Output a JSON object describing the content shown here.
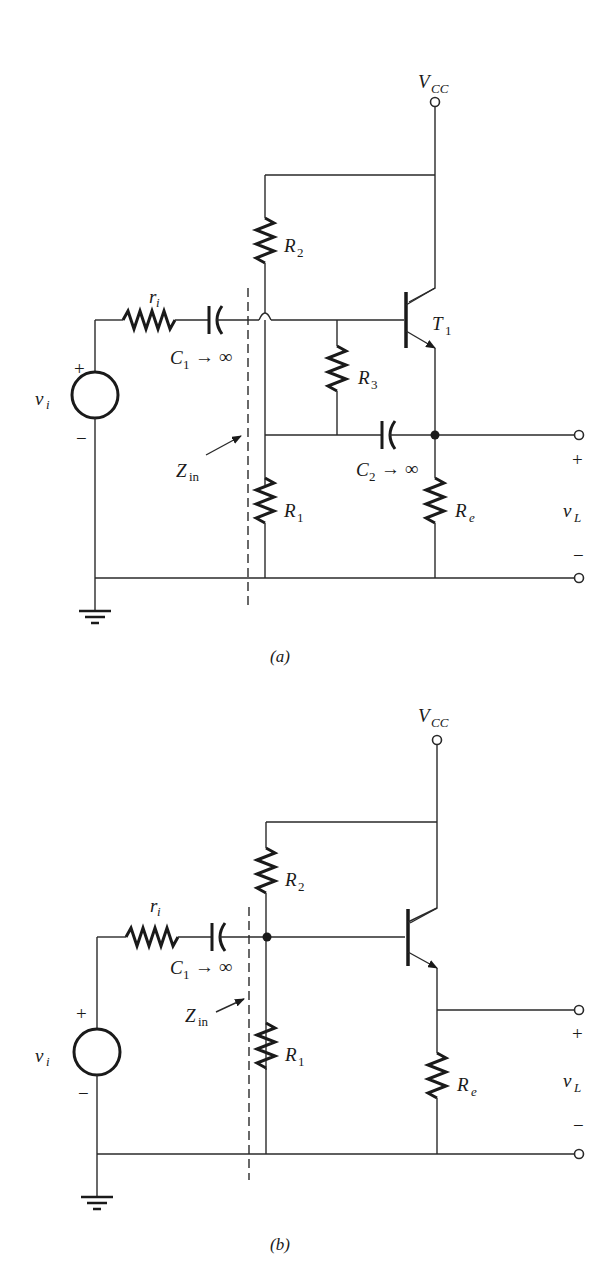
{
  "figure": {
    "colors": {
      "ink": "#1a1a1a",
      "background": "#ffffff"
    }
  },
  "circuit_a": {
    "caption": "(a)",
    "supply": {
      "label": "V",
      "sub": "CC"
    },
    "source": {
      "label": "v",
      "sub": "i",
      "plus": "+",
      "minus": "−"
    },
    "source_resistor": {
      "label": "r",
      "sub": "i"
    },
    "c1": {
      "label": "C",
      "sub": "1",
      "note": "→ ∞"
    },
    "c2": {
      "label": "C",
      "sub": "2",
      "note": "→ ∞"
    },
    "r1": {
      "label": "R",
      "sub": "1"
    },
    "r2": {
      "label": "R",
      "sub": "2"
    },
    "r3": {
      "label": "R",
      "sub": "3"
    },
    "re": {
      "label": "R",
      "sub": "e"
    },
    "transistor": {
      "label": "T",
      "sub": "1"
    },
    "zin": {
      "label": "Z",
      "sub": "in"
    },
    "output": {
      "label": "v",
      "sub": "L",
      "plus": "+",
      "minus": "−"
    }
  },
  "circuit_b": {
    "caption": "(b)",
    "supply": {
      "label": "V",
      "sub": "CC"
    },
    "source": {
      "label": "v",
      "sub": "i",
      "plus": "+",
      "minus": "−"
    },
    "source_resistor": {
      "label": "r",
      "sub": "i"
    },
    "c1": {
      "label": "C",
      "sub": "1",
      "note": "→ ∞"
    },
    "r1": {
      "label": "R",
      "sub": "1"
    },
    "r2": {
      "label": "R",
      "sub": "2"
    },
    "re": {
      "label": "R",
      "sub": "e"
    },
    "zin": {
      "label": "Z",
      "sub": "in"
    },
    "output": {
      "label": "v",
      "sub": "L",
      "plus": "+",
      "minus": "−"
    }
  }
}
